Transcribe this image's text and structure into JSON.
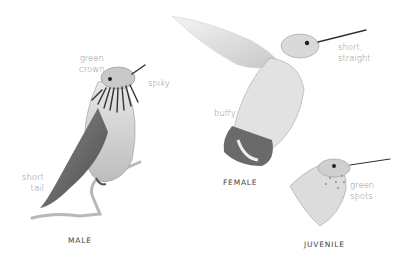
{
  "figure": {
    "birds": [
      {
        "id": "male",
        "caption": "MALE",
        "notes": [
          {
            "id": "crown",
            "text": "green\ncrown"
          },
          {
            "id": "gorget",
            "text": "spiky"
          },
          {
            "id": "tail",
            "text": "short\ntail"
          }
        ]
      },
      {
        "id": "female",
        "caption": "FEMALE",
        "notes": [
          {
            "id": "bill",
            "text": "short,\nstraight"
          },
          {
            "id": "flanks",
            "text": "buffy"
          }
        ]
      },
      {
        "id": "juvenile",
        "caption": "JUVENILE",
        "notes": [
          {
            "id": "throat",
            "text": "green\nspots"
          }
        ]
      }
    ],
    "colors": {
      "ink": "#3a3a3a",
      "shade": "#9a9a9a",
      "light": "#d8d8d8",
      "note": "#8a8a8a"
    }
  }
}
